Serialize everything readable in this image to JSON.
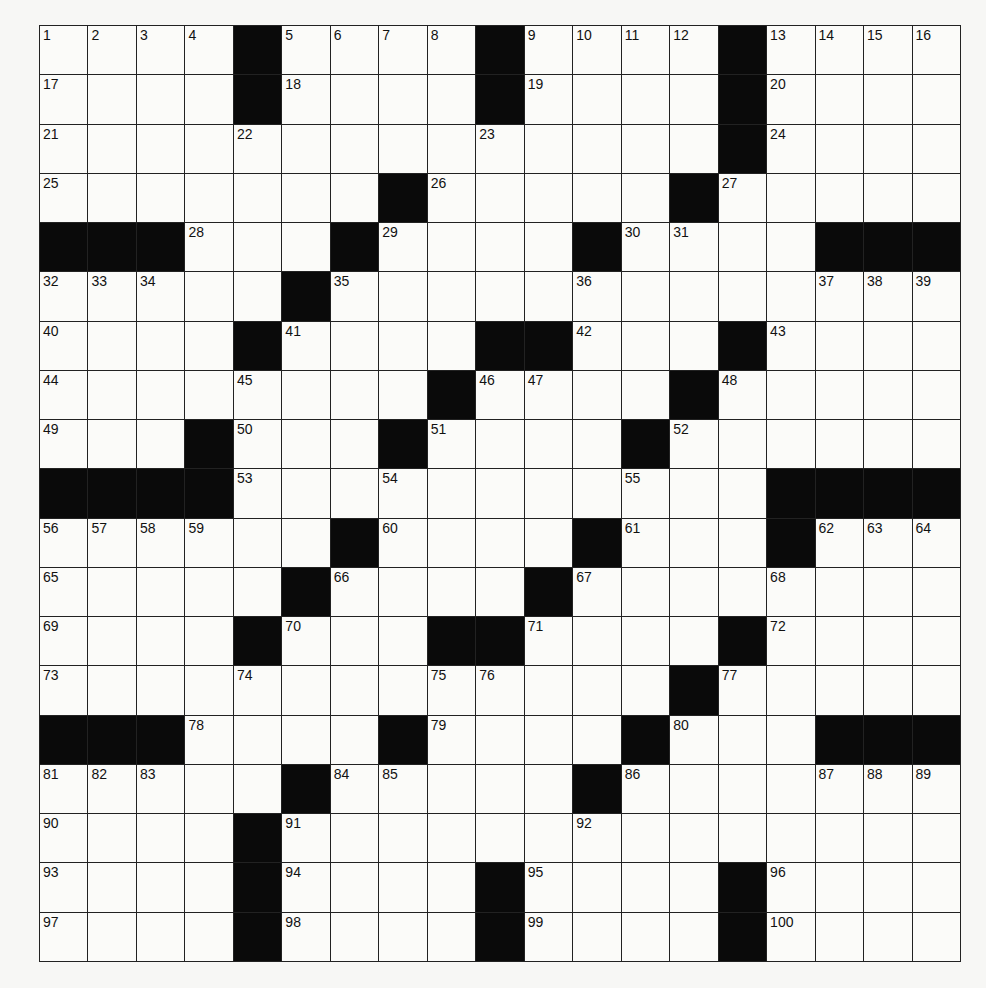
{
  "puzzle": {
    "rows": 19,
    "cols": 19,
    "colors": {
      "block": "#0a0a0a",
      "cell": "#fbfbf9",
      "line": "#222222"
    },
    "grid": [
      "1 2 3 4 # 5 6 7 8 # 9 10 11 12 # 13 14 15 16",
      "17 . . . # 18 . . . # 19 . . . # 20 . . .",
      "21 . . . 22 . . . . 23 . . . . # 24 . . .",
      "25 . . . . . . # 26 . . . . # 27 . . . .",
      "# # # 28 . . # 29 . . . # 30 31 . . # # #",
      "32 33 34 . . # 35 . . . . 36 . . . . 37 38 39",
      "40 . . . # 41 . . . # # 42 . . # 43 . . .",
      "44 . . . 45 . . . # 46 47 . . # 48 . . . .",
      "49 . . # 50 . . # 51 . . . # 52 . . . . .",
      "# # # # 53 . . 54 . . . . 55 . . # # # #",
      "56 57 58 59 . . # 60 . . . # 61 . . # 62 63 64",
      "65 . . . . # 66 . . . # 67 . . . 68 . . .",
      "69 . . . # 70 . . # # 71 . . . # 72 . . .",
      "73 . . . 74 . . . 75 76 . . . # 77 . . . .",
      "# # # 78 . . . # 79 . . . # 80 . . # # #",
      "81 82 83 . . # 84 85 . . . # 86 . . . 87 88 89",
      "90 . . . # 91 . . . . . 92 . . . . . . .",
      "93 . . . # 94 . . . # 95 . . . # 96 . . .",
      "97 . . . # 98 . . . # 99 . . . # 100 . . ."
    ]
  }
}
